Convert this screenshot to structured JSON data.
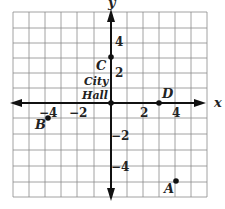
{
  "diagram": {
    "type": "coordinate-grid",
    "axes": {
      "x_label": "x",
      "y_label": "y"
    },
    "x_ticks": [
      {
        "label": "−4",
        "value": -4
      },
      {
        "label": "−2",
        "value": -2
      },
      {
        "label": "2",
        "value": 2
      },
      {
        "label": "4",
        "value": 4
      }
    ],
    "y_ticks": [
      {
        "label": "4",
        "value": 4
      },
      {
        "label": "2",
        "value": 2
      },
      {
        "label": "−2",
        "value": -2
      },
      {
        "label": "−4",
        "value": -4
      }
    ],
    "origin_label_line1": "City",
    "origin_label_line2": "Hall",
    "points": [
      {
        "name": "A",
        "x": 4,
        "y": -5
      },
      {
        "name": "B",
        "x": -4,
        "y": -1
      },
      {
        "name": "C",
        "x": 0,
        "y": 3
      },
      {
        "name": "D",
        "x": 3,
        "y": 0
      }
    ],
    "grid": {
      "x_min": -6,
      "x_max": 6,
      "y_min": -6,
      "y_max": 6
    },
    "colors": {
      "grid": "#8a8a8a",
      "axis": "#111111",
      "point": "#111111"
    }
  }
}
